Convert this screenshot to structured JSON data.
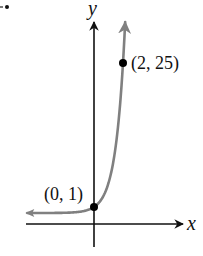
{
  "chart_data": {
    "type": "line",
    "title": "",
    "xlabel": "x",
    "ylabel": "y",
    "function": "y = 5^x",
    "series": [
      {
        "name": "exponential curve",
        "color": "#808080",
        "x": [
          -4.6,
          -3,
          -2,
          -1,
          0,
          0.5,
          1,
          1.5,
          2,
          2.2
        ],
        "y": [
          0.0006,
          0.008,
          0.04,
          0.2,
          1,
          2.236,
          5,
          11.18,
          25,
          34.5
        ]
      }
    ],
    "points": [
      {
        "x": 0,
        "y": 1,
        "label": "(0, 1)"
      },
      {
        "x": 2,
        "y": 25,
        "label": "(2, 25)"
      }
    ],
    "grid": false,
    "legend": "none"
  },
  "axes": {
    "x_label": "x",
    "y_label": "y"
  },
  "annotations": {
    "point_a_label": "(0, 1)",
    "point_b_label": "(2, 25)",
    "corner_mark": "·•"
  },
  "colors": {
    "axis": "#111111",
    "curve": "#808080",
    "point": "#000000"
  }
}
